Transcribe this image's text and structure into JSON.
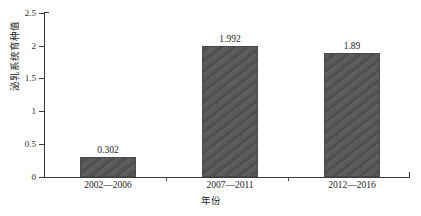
{
  "chart_data": {
    "type": "bar",
    "title": "",
    "xlabel": "年份",
    "ylabel": "泌乳系统育种值",
    "categories": [
      "2002—2006",
      "2007—2011",
      "2012—2016"
    ],
    "values": [
      0.302,
      1.992,
      1.89
    ],
    "value_labels": [
      "0.302",
      "1.992",
      "1.89"
    ],
    "ylim": [
      0,
      2.5
    ],
    "yticks": [
      0,
      0.5,
      1,
      1.5,
      2,
      2.5
    ],
    "ytick_labels": [
      "0",
      "0.5",
      "1",
      "1.5",
      "2",
      "2.5"
    ],
    "grid": false,
    "legend": false,
    "legend_position": "none",
    "bar_color": "#555555",
    "bar_pattern": "diagonal-hatch",
    "axis_color": "#3a3a3a"
  }
}
